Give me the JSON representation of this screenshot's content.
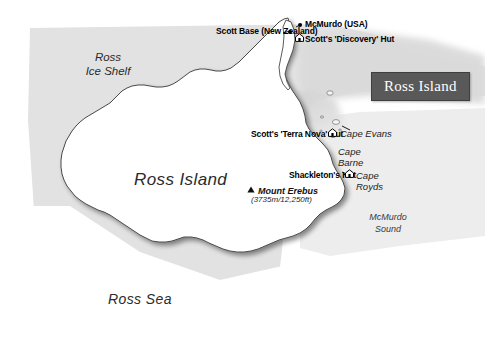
{
  "map": {
    "title": "Ross Island",
    "colors": {
      "ice_shelf_fill": "#e2e2e2",
      "island_fill": "#ffffff",
      "coast_stroke": "#4a4a4a",
      "bay_shade": "#c9c9c9",
      "plaque_bg": "#595959",
      "plaque_text": "#ffffff",
      "label_text": "#000000"
    },
    "geographic_labels": [
      {
        "id": "ross-ice-shelf",
        "line1": "Ross",
        "line2": "Ice Shelf"
      },
      {
        "id": "ross-island",
        "text": "Ross Island"
      },
      {
        "id": "ross-sea",
        "text": "Ross Sea"
      },
      {
        "id": "mcmurdo-sound",
        "line1": "McMurdo",
        "line2": "Sound"
      }
    ],
    "settlements": [
      {
        "id": "scott-base",
        "label": "Scott Base (New Zealand)",
        "marker": "dot-marker"
      },
      {
        "id": "mcmurdo-station",
        "label": "McMurdo (USA)",
        "marker": "dot-marker"
      }
    ],
    "huts": [
      {
        "id": "discovery-hut",
        "label": "Scott's 'Discovery' Hut",
        "marker": "hut-icon"
      },
      {
        "id": "terra-nova-hut",
        "label": "Scott's 'Terra Nova' Hut",
        "marker": "hut-icon"
      },
      {
        "id": "shackletons-hut",
        "label": "Shackleton's Hut",
        "marker": "hut-icon"
      }
    ],
    "capes": [
      {
        "id": "cape-evans",
        "text": "Cape Evans"
      },
      {
        "id": "cape-barne",
        "line1": "Cape",
        "line2": "Barne"
      },
      {
        "id": "cape-royds",
        "line1": "Cape",
        "line2": "Royds"
      }
    ],
    "peak": {
      "id": "mount-erebus",
      "name": "Mount Erebus",
      "elevation": "(3735m/12,250ft)",
      "marker": "peak-icon"
    }
  }
}
